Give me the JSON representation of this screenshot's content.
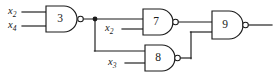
{
  "figure": {
    "name": "logic-circuit-nand-network",
    "type": "logic-circuit-diagram",
    "width": 279,
    "height": 75,
    "background_color": "#ffffff",
    "line_color": "#1a1a1a"
  },
  "gates": [
    {
      "id": "gate-3",
      "label": "3",
      "type": "NAND",
      "shape": "and-with-bubble",
      "inputs": [
        "x2",
        "x4"
      ],
      "output": "g3",
      "body": {
        "x": 46,
        "y": 6,
        "w": 32,
        "h": 26
      },
      "bubble": {
        "cx": 80.5,
        "cy": 19,
        "r": 2.8
      },
      "label_pos": {
        "x": 60,
        "y": 19
      }
    },
    {
      "id": "gate-7",
      "label": "7",
      "type": "NAND",
      "shape": "and-with-bubble",
      "inputs": [
        "g3",
        "x2"
      ],
      "output": "g7",
      "body": {
        "x": 143,
        "y": 9,
        "w": 30,
        "h": 26
      },
      "bubble": {
        "cx": 175.5,
        "cy": 22,
        "r": 2.8
      },
      "label_pos": {
        "x": 156,
        "y": 22
      }
    },
    {
      "id": "gate-8",
      "label": "8",
      "type": "NAND",
      "shape": "and-with-bubble",
      "inputs": [
        "g3",
        "x3"
      ],
      "output": "g8",
      "body": {
        "x": 145,
        "y": 45,
        "w": 30,
        "h": 26
      },
      "bubble": {
        "cx": 177.5,
        "cy": 58,
        "r": 2.8
      },
      "label_pos": {
        "x": 158,
        "y": 58
      }
    },
    {
      "id": "gate-9",
      "label": "9",
      "type": "NAND",
      "shape": "and-with-bubble",
      "inputs": [
        "g7",
        "g8"
      ],
      "output": "f",
      "body": {
        "x": 212,
        "y": 11,
        "w": 31,
        "h": 28
      },
      "bubble": {
        "cx": 245.5,
        "cy": 25,
        "r": 2.8
      },
      "label_pos": {
        "x": 225,
        "y": 25
      }
    }
  ],
  "signals": [
    {
      "id": "label-x2-top",
      "base": "x",
      "subscript": "2",
      "text": "x2",
      "pos": {
        "x": 8,
        "y": 12
      },
      "wire": {
        "x1": 22,
        "y1": 12,
        "x2": 46,
        "y2": 12
      },
      "target": "gate-3"
    },
    {
      "id": "label-x4",
      "base": "x",
      "subscript": "4",
      "text": "x4",
      "pos": {
        "x": 8,
        "y": 26
      },
      "wire": {
        "x1": 22,
        "y1": 26,
        "x2": 46,
        "y2": 26
      },
      "target": "gate-3"
    },
    {
      "id": "label-x2-mid",
      "base": "x",
      "subscript": "2",
      "text": "x2",
      "pos": {
        "x": 105,
        "y": 29
      },
      "wire": {
        "x1": 122,
        "y1": 29,
        "x2": 143,
        "y2": 29
      },
      "target": "gate-7"
    },
    {
      "id": "label-x3",
      "base": "x",
      "subscript": "3",
      "text": "x3",
      "pos": {
        "x": 108,
        "y": 63
      },
      "wire": {
        "x1": 125,
        "y1": 63,
        "x2": 145,
        "y2": 63
      },
      "target": "gate-8"
    }
  ],
  "nets": [
    {
      "id": "net-g3-fanout",
      "from": "gate-3",
      "to": [
        "gate-7",
        "gate-8"
      ],
      "junction": {
        "cx": 95,
        "cy": 19,
        "r": 2.4
      },
      "segments": [
        {
          "x1": 83.3,
          "y1": 19,
          "x2": 143,
          "y2": 19
        },
        {
          "x1": 95,
          "y1": 19,
          "x2": 95,
          "y2": 51
        },
        {
          "x1": 95,
          "y1": 51,
          "x2": 145,
          "y2": 51
        }
      ]
    },
    {
      "id": "net-g7-out",
      "from": "gate-7",
      "to": [
        "gate-9"
      ],
      "segments": [
        {
          "x1": 178.3,
          "y1": 22,
          "x2": 212,
          "y2": 22
        }
      ]
    },
    {
      "id": "net-g8-out",
      "from": "gate-8",
      "to": [
        "gate-9"
      ],
      "segments": [
        {
          "x1": 180.3,
          "y1": 58,
          "x2": 191,
          "y2": 58
        },
        {
          "x1": 191,
          "y1": 58,
          "x2": 191,
          "y2": 32
        },
        {
          "x1": 191,
          "y1": 32,
          "x2": 212,
          "y2": 32
        }
      ]
    },
    {
      "id": "net-output",
      "from": "gate-9",
      "to": [],
      "segments": [
        {
          "x1": 248.3,
          "y1": 25,
          "x2": 272,
          "y2": 25
        }
      ]
    }
  ]
}
